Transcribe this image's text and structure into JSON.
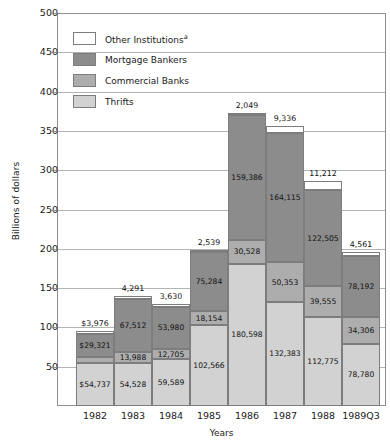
{
  "chart_data": {
    "type": "bar",
    "stacked": true,
    "title": "",
    "xlabel": "Years",
    "ylabel": "Billions of dollars",
    "ylim": [
      0,
      500
    ],
    "ytick_values": [
      50,
      100,
      150,
      200,
      250,
      300,
      350,
      400,
      450,
      500
    ],
    "ytick_labels": [
      "50",
      "100",
      "150",
      "200",
      "250",
      "300",
      "350",
      "400",
      "450",
      "500"
    ],
    "grid": true,
    "units_note": "Segment labels are in millions of dollars; axis is in billions of dollars.",
    "categories": [
      "1982",
      "1983",
      "1984",
      "1985",
      "1986",
      "1987",
      "1988",
      "1989Q3"
    ],
    "legend_position": "upper-left-inside",
    "series": [
      {
        "name": "Thrifts",
        "color": "#d2d2d2",
        "values": [
          54737,
          54528,
          59589,
          102566,
          180598,
          132383,
          112775,
          78780
        ],
        "labels": [
          "$54,737",
          "54,528",
          "59,589",
          "102,566",
          "180,598",
          "132,383",
          "112,775",
          "78,780"
        ]
      },
      {
        "name": "Commercial Banks",
        "color": "#adadad",
        "values": [
          7896,
          13988,
          12705,
          18154,
          30528,
          50353,
          39555,
          34306
        ],
        "labels": [
          "$7,896",
          "13,988",
          "12,705",
          "18,154",
          "30,528",
          "50,353",
          "39,555",
          "34,306"
        ]
      },
      {
        "name": "Mortgage Bankers",
        "color": "#8c8c8c",
        "values": [
          29321,
          67512,
          53980,
          75284,
          159386,
          164115,
          122505,
          78192
        ],
        "labels": [
          "$29,321",
          "67,512",
          "53,980",
          "75,284",
          "159,386",
          "164,115",
          "122,505",
          "78,192"
        ]
      },
      {
        "name": "Other Institutions",
        "color": "#ffffff",
        "legend_superscript": "a",
        "values": [
          3976,
          4291,
          3630,
          2539,
          2049,
          9336,
          11212,
          4561
        ],
        "labels": [
          "$3,976",
          "4,291",
          "3,630",
          "2,539",
          "2,049",
          "9,336",
          "11,212",
          "4,561"
        ]
      }
    ],
    "totals": [
      95930,
      140319,
      129904,
      198543,
      372561,
      356187,
      286047,
      195839
    ]
  }
}
